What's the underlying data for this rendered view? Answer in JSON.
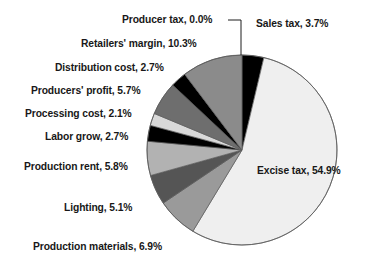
{
  "chart_data": {
    "type": "pie",
    "title": "",
    "subtitle": "",
    "xlabel": "",
    "ylabel": "",
    "grid": false,
    "legend_position": "none",
    "label_format": "{name}, {value}%",
    "units": "percent",
    "start_angle_deg": 0,
    "direction": "clockwise",
    "total": 100.0,
    "categories": [
      "Producer tax",
      "Sales tax",
      "Excise tax",
      "Production materials",
      "Lighting",
      "Production rent",
      "Labor grow",
      "Processing cost",
      "Producers' profit",
      "Distribution cost",
      "Retailers' margin"
    ],
    "values": [
      0.0,
      3.7,
      54.9,
      6.9,
      5.1,
      5.8,
      2.7,
      2.1,
      5.7,
      2.7,
      10.3
    ],
    "colors": [
      "#000000",
      "#000000",
      "#efefef",
      "#9a9a9a",
      "#555555",
      "#b2b2b2",
      "#000000",
      "#d9d9d9",
      "#6e6e6e",
      "#000000",
      "#8b8b8b"
    ],
    "slices": [
      {
        "name": "Producer tax",
        "value": 0.0,
        "label": "Producer tax, 0.0%",
        "color": "#000000",
        "has_leader_line": true
      },
      {
        "name": "Sales tax",
        "value": 3.7,
        "label": "Sales tax, 3.7%",
        "color": "#000000",
        "has_leader_line": false
      },
      {
        "name": "Excise tax",
        "value": 54.9,
        "label": "Excise tax, 54.9%",
        "color": "#efefef",
        "has_leader_line": false
      },
      {
        "name": "Production materials",
        "value": 6.9,
        "label": "Production materials, 6.9%",
        "color": "#9a9a9a",
        "has_leader_line": false
      },
      {
        "name": "Lighting",
        "value": 5.1,
        "label": "Lighting, 5.1%",
        "color": "#555555",
        "has_leader_line": false
      },
      {
        "name": "Production rent",
        "value": 5.8,
        "label": "Production rent, 5.8%",
        "color": "#b2b2b2",
        "has_leader_line": false
      },
      {
        "name": "Labor grow",
        "value": 2.7,
        "label": "Labor grow, 2.7%",
        "color": "#000000",
        "has_leader_line": false
      },
      {
        "name": "Processing cost",
        "value": 2.1,
        "label": "Processing cost, 2.1%",
        "color": "#d9d9d9",
        "has_leader_line": false
      },
      {
        "name": "Producers' profit",
        "value": 5.7,
        "label": "Producers' profit, 5.7%",
        "color": "#6e6e6e",
        "has_leader_line": false
      },
      {
        "name": "Distribution cost",
        "value": 2.7,
        "label": "Distribution cost, 2.7%",
        "color": "#000000",
        "has_leader_line": false
      },
      {
        "name": "Retailers' margin",
        "value": 10.3,
        "label": "Retailers' margin, 10.3%",
        "color": "#8b8b8b",
        "has_leader_line": false
      }
    ]
  },
  "geometry": {
    "center_x": 242,
    "center_y": 150,
    "radius": 95,
    "outline_color": "#5a5a5a",
    "background": "#ffffff"
  },
  "labels": {
    "producer_tax": {
      "text": "Producer tax, 0.0%",
      "x": 122,
      "y": 14,
      "align": "left"
    },
    "sales_tax": {
      "text": "Sales tax, 3.7%",
      "x": 256,
      "y": 18,
      "align": "left"
    },
    "retailers_margin": {
      "text": "Retailers' margin, 10.3%",
      "x": 81,
      "y": 38,
      "align": "left"
    },
    "distribution_cost": {
      "text": "Distribution cost, 2.7%",
      "x": 55,
      "y": 62,
      "align": "left"
    },
    "producers_profit": {
      "text": "Producers' profit, 5.7%",
      "x": 31,
      "y": 85,
      "align": "left"
    },
    "processing_cost": {
      "text": "Processing cost, 2.1%",
      "x": 25,
      "y": 108,
      "align": "left"
    },
    "labor_grow": {
      "text": "Labor grow, 2.7%",
      "x": 45,
      "y": 131,
      "align": "left"
    },
    "production_rent": {
      "text": "Production rent, 5.8%",
      "x": 24,
      "y": 161,
      "align": "left"
    },
    "lighting": {
      "text": "Lighting, 5.1%",
      "x": 64,
      "y": 202,
      "align": "left"
    },
    "production_materials": {
      "text": "Production materials, 6.9%",
      "x": 33,
      "y": 241,
      "align": "left"
    },
    "excise_tax": {
      "text": "Excise tax, 54.9%",
      "x": 257,
      "y": 165,
      "align": "left"
    }
  }
}
